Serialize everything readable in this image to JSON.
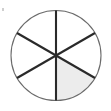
{
  "figure": {
    "name": "fraction-circle",
    "title": "Circle divided into six equal sectors with one sector shaded",
    "canvas": {
      "width": 111,
      "height": 111,
      "background_color": "#ffffff"
    },
    "circle": {
      "center_x": 56,
      "center_y": 55.5,
      "radius": 45,
      "outline_color": "#6b6b6b",
      "outline_width": 1.1,
      "fill_color": "#ffffff"
    },
    "divisions": {
      "sector_count": 6,
      "sector_angle_degrees": 60,
      "diameter_count": 3,
      "line_color": "#2a2a2a",
      "line_width": 2.1,
      "diameter_angles_degrees": [
        90,
        30,
        150
      ]
    },
    "shading": {
      "shaded_sector_count": 1,
      "shaded_fill_color": "#ececec",
      "shaded_start_angle_degrees": 270,
      "shaded_end_angle_degrees": 330,
      "position_label": "lower-right"
    },
    "fraction": {
      "numerator": 1,
      "denominator": 6,
      "text": "1/6"
    },
    "artifact": {
      "name": "scan-speck",
      "x": 2,
      "y": 8,
      "width": 2,
      "height": 3,
      "color": "#cfcfcf"
    }
  }
}
